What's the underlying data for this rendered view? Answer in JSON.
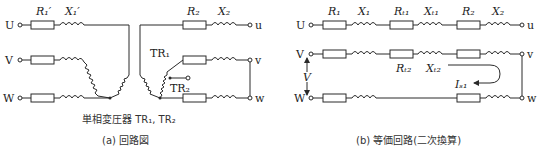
{
  "diagram_a": {
    "caption": "(a) 回路図",
    "transformer_label": "単相変圧器 TR₁, TR₂",
    "left_terminals": [
      "U",
      "V",
      "W"
    ],
    "right_terminals": [
      "u",
      "v",
      "w"
    ],
    "labels": {
      "R1p": "R₁′",
      "X1p": "X₁′",
      "R2": "R₂",
      "X2": "X₂",
      "TR1": "TR₁",
      "TR2": "TR₂"
    }
  },
  "diagram_b": {
    "caption": "(b) 等価回路(二次換算)",
    "left_terminals": [
      "U",
      "V",
      "W"
    ],
    "right_terminals": [
      "u",
      "v",
      "w"
    ],
    "labels": {
      "R1": "R₁",
      "X1": "X₁",
      "Rt1": "Rₜ₁",
      "Xt1": "Xₜ₁",
      "R2": "R₂",
      "X2": "X₂",
      "Rt2": "Rₜ₂",
      "Xt2": "Xₜ₂",
      "V": "V",
      "Is1": "Iₛ₁"
    }
  }
}
